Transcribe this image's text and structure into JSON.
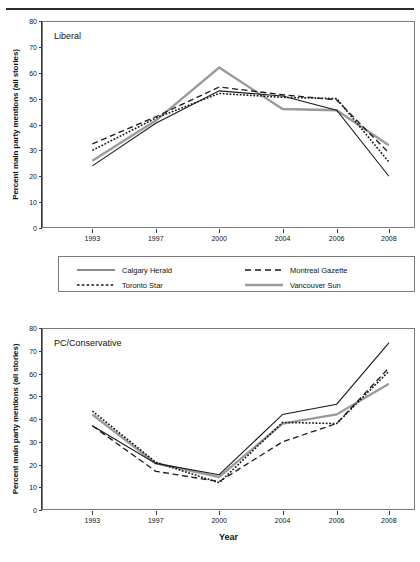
{
  "figure": {
    "ghost_caption": "",
    "ylabel": "Percent main party mentions (all stories)",
    "xlabel": "Year"
  },
  "legend": {
    "items": [
      {
        "label": "Calgary Herald",
        "style": "solid",
        "color": "#1a1a1a",
        "width": 1.1
      },
      {
        "label": "Montreal Gazette",
        "style": "dashed",
        "color": "#1a1a1a",
        "width": 1.3
      },
      {
        "label": "Toronto Star",
        "style": "dotted",
        "color": "#1a1a1a",
        "width": 1.6
      },
      {
        "label": "Vancouver Sun",
        "style": "solid-gray",
        "color": "#9a9a9a",
        "width": 2.4
      }
    ]
  },
  "chart_data": [
    {
      "type": "line",
      "title": "Liberal",
      "xlabel": "",
      "ylabel": "Percent main party mentions (all stories)",
      "categories": [
        "1993",
        "1997",
        "2000",
        "2004",
        "2006",
        "2008"
      ],
      "ylim": [
        0,
        80
      ],
      "yticks": [
        0,
        10,
        20,
        30,
        40,
        50,
        60,
        70,
        80
      ],
      "grid": false,
      "legend_position": "below",
      "series": [
        {
          "name": "Calgary Herald",
          "values": [
            24.0,
            40.5,
            53.0,
            51.0,
            45.5,
            20.0
          ]
        },
        {
          "name": "Montreal Gazette",
          "values": [
            32.5,
            43.0,
            54.5,
            51.5,
            49.5,
            29.0
          ]
        },
        {
          "name": "Toronto Star",
          "values": [
            30.0,
            42.5,
            52.0,
            50.5,
            50.0,
            25.5
          ]
        },
        {
          "name": "Vancouver Sun",
          "values": [
            26.0,
            41.5,
            62.0,
            46.0,
            45.5,
            32.0
          ]
        }
      ]
    },
    {
      "type": "line",
      "title": "PC/Conservative",
      "xlabel": "Year",
      "ylabel": "Percent main party mentions (all stories)",
      "categories": [
        "1993",
        "1997",
        "2000",
        "2004",
        "2006",
        "2008"
      ],
      "ylim": [
        0,
        80
      ],
      "yticks": [
        0,
        10,
        20,
        30,
        40,
        50,
        60,
        70,
        80
      ],
      "grid": false,
      "legend_position": "none",
      "series": [
        {
          "name": "Calgary Herald",
          "values": [
            37.0,
            20.5,
            15.5,
            42.0,
            46.5,
            73.5
          ]
        },
        {
          "name": "Montreal Gazette",
          "values": [
            37.0,
            17.0,
            12.5,
            30.0,
            38.0,
            62.5
          ]
        },
        {
          "name": "Toronto Star",
          "values": [
            43.5,
            21.0,
            12.0,
            38.5,
            38.0,
            61.0
          ]
        },
        {
          "name": "Vancouver Sun",
          "values": [
            42.0,
            20.5,
            14.5,
            38.0,
            42.0,
            55.5
          ]
        }
      ]
    }
  ]
}
